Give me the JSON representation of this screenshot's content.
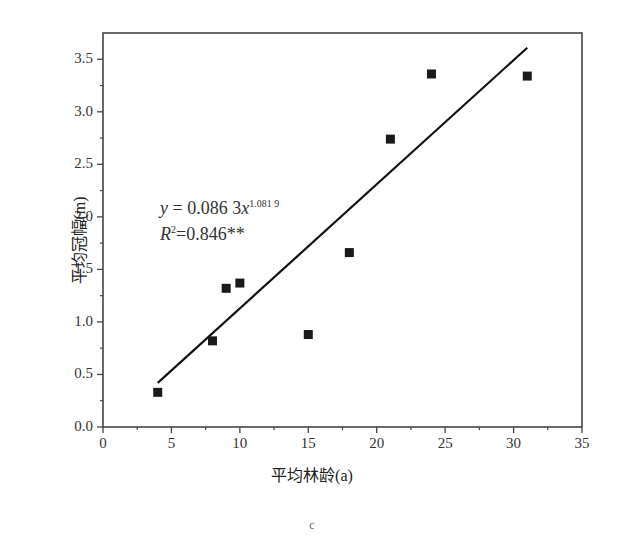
{
  "chart_data": {
    "type": "scatter",
    "title": "",
    "xlabel": "平均林龄(a)",
    "ylabel": "平均冠幅(m)",
    "xlim": [
      0,
      35
    ],
    "ylim": [
      0,
      3.75
    ],
    "x_ticks": [
      0,
      5,
      10,
      15,
      20,
      25,
      30,
      35
    ],
    "y_ticks": [
      0.0,
      0.5,
      1.0,
      1.5,
      2.0,
      2.5,
      3.0,
      3.5
    ],
    "x_tick_labels": [
      "0",
      "5",
      "10",
      "15",
      "20",
      "25",
      "30",
      "35"
    ],
    "y_tick_labels": [
      "0.0",
      "0.5",
      "1.0",
      "1.5",
      "2.0",
      "2.5",
      "3.0",
      "3.5"
    ],
    "grid": false,
    "legend": null,
    "series": [
      {
        "name": "observed",
        "marker": "square",
        "x": [
          4,
          8,
          9,
          10,
          15,
          18,
          21,
          24,
          31
        ],
        "y": [
          0.33,
          0.82,
          1.32,
          1.37,
          0.88,
          1.66,
          2.74,
          3.36,
          3.34
        ]
      },
      {
        "name": "fit",
        "type": "line",
        "equation": "y = 0.0863x^1.0819",
        "x": [
          4,
          31
        ],
        "y": [
          0.42,
          3.61
        ]
      }
    ],
    "annotations": {
      "equation_prefix": "y",
      "equation_body": " = 0.086 3",
      "equation_var": "x",
      "equation_exp": "1.081 9",
      "r2_label": "R",
      "r2_exp": "2",
      "r2_value": "=0.846**"
    },
    "caption": "c"
  }
}
